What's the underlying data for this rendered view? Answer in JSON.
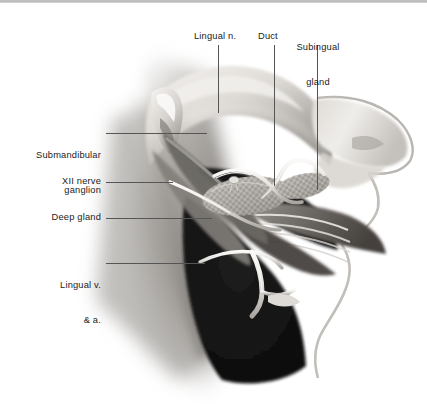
{
  "figure": {
    "type": "anatomical-illustration",
    "style": "grayscale airbrush medical illustration",
    "width": 427,
    "height": 404,
    "background_color": "#ffffff",
    "border": {
      "edge": "top",
      "color": "#b4b4b4",
      "thickness_px": 3
    }
  },
  "palette": {
    "text": "#1b1b1b",
    "leader_line": "#555555",
    "background": "#ffffff",
    "tissue_light": "#e8e6e3",
    "tissue_mid": "#a8a49f",
    "tissue_dark": "#5c5853",
    "cavity_black": "#141414",
    "highlight": "#f4f2ef"
  },
  "labels": {
    "lingual_nerve": {
      "text": "Lingual n.",
      "lines": [
        "Lingual n."
      ],
      "align": "center",
      "position": "top",
      "x": 194,
      "y": 31
    },
    "duct": {
      "text": "Duct",
      "lines": [
        "Duct"
      ],
      "align": "center",
      "position": "top",
      "x": 258,
      "y": 31
    },
    "subingual_gland": {
      "text": "Subingual gland",
      "lines": [
        "Subingual",
        "gland"
      ],
      "align": "center",
      "position": "top",
      "x": 292,
      "y": 19
    },
    "submandibular_ganglion": {
      "text": "Submandibular ganglion",
      "lines": [
        "Submandibular",
        "ganglion"
      ],
      "align": "right",
      "position": "left",
      "x": 17,
      "y": 127
    },
    "xii_nerve": {
      "text": "XII nerve",
      "lines": [
        "XII nerve"
      ],
      "align": "right",
      "position": "left",
      "x": 47,
      "y": 176
    },
    "deep_gland": {
      "text": "Deep gland",
      "lines": [
        "Deep gland"
      ],
      "align": "right",
      "position": "left",
      "x": 38,
      "y": 212
    },
    "lingual_vein_artery": {
      "text": "Lingual v. & a.",
      "lines": [
        "Lingual v.",
        "& a."
      ],
      "align": "right",
      "position": "left",
      "x": 44,
      "y": 257
    }
  },
  "leader_lines": [
    {
      "name": "lingual-n-leader",
      "orientation": "vertical",
      "x": 218,
      "y1": 45,
      "y2": 113
    },
    {
      "name": "duct-leader",
      "orientation": "vertical",
      "x": 274,
      "y1": 45,
      "y2": 186
    },
    {
      "name": "subingual-gland-leader",
      "orientation": "vertical",
      "x": 317,
      "y1": 45,
      "y2": 190
    },
    {
      "name": "submandibular-ganglion-leader",
      "orientation": "horizontal",
      "x1": 106,
      "x2": 207,
      "y": 133
    },
    {
      "name": "xii-nerve-leader",
      "orientation": "horizontal",
      "x1": 106,
      "x2": 173,
      "y": 182
    },
    {
      "name": "deep-gland-leader",
      "orientation": "horizontal",
      "x1": 106,
      "x2": 212,
      "y": 218
    },
    {
      "name": "lingual-v-a-leader",
      "orientation": "horizontal",
      "x1": 106,
      "x2": 205,
      "y": 263
    }
  ],
  "structures": [
    {
      "name": "mandible-bone",
      "description": "bone stump at upper left of cavity"
    },
    {
      "name": "tongue-body",
      "description": "large light mass across upper center"
    },
    {
      "name": "submandibular-gland",
      "description": "textured stippled gland in center"
    },
    {
      "name": "sublingual-gland",
      "description": "textured stippled gland right of center"
    },
    {
      "name": "submandibular-duct",
      "description": "pale tube running forward from gland"
    },
    {
      "name": "lingual-nerve",
      "description": "pale cord looping over duct"
    },
    {
      "name": "hypoglossal-nerve",
      "description": "pale cord running low and forward"
    },
    {
      "name": "mylohyoid-muscle",
      "description": "banded muscle sheet along lower right"
    },
    {
      "name": "lip-chin-profile",
      "description": "outlined facial profile at right"
    },
    {
      "name": "oral-cavity",
      "description": "dark region below tongue"
    },
    {
      "name": "neck-muscle-fibers",
      "description": "soft diagonal striated fade at left"
    }
  ]
}
